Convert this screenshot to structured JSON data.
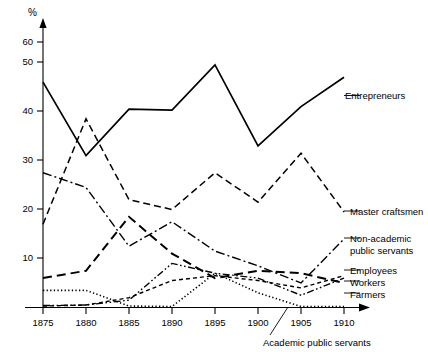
{
  "chart_data": {
    "type": "line",
    "title": "",
    "xlabel": "",
    "ylabel": "%",
    "y_unit_symbol": "%",
    "x": [
      1875,
      1880,
      1885,
      1890,
      1895,
      1900,
      1905,
      1910
    ],
    "xtick_labels": [
      "1875",
      "1880",
      "1885",
      "1890",
      "1895",
      "1900",
      "1905",
      "1910"
    ],
    "ytick_labels": [
      "10",
      "20",
      "30",
      "40",
      "50",
      "60"
    ],
    "ytick_values": [
      10,
      20,
      30,
      40,
      50,
      60
    ],
    "xlim": [
      1875,
      1911
    ],
    "ylim": [
      0,
      64
    ],
    "grid": false,
    "legend_position": "right-inline",
    "series": [
      {
        "name": "Entrepreneurs",
        "label": "Entrepreneurs",
        "style": "solid",
        "dash": "none",
        "width": 1.7,
        "values": [
          46,
          31,
          40.5,
          40.3,
          49.5,
          33,
          41,
          47
        ]
      },
      {
        "name": "Master craftsmen",
        "label": "Master craftsmen",
        "style": "dashed",
        "dash": "7,4",
        "width": 1.5,
        "values": [
          17,
          38.5,
          22,
          20,
          27.5,
          21.5,
          31.5,
          19.5
        ]
      },
      {
        "name": "Non-academic public servants",
        "label": "Non-academic\npublic servants",
        "label_line1": "Non-academic",
        "label_line2": "public servants",
        "style": "dash-dot",
        "dash": "9,3,2,3",
        "width": 1.4,
        "values": [
          27.5,
          24.5,
          12.5,
          17.5,
          11.5,
          8.5,
          5,
          14
        ]
      },
      {
        "name": "Employees",
        "label": "Employees",
        "style": "long-dash",
        "dash": "9,5",
        "width": 2.0,
        "values": [
          6,
          7.5,
          18.5,
          11,
          6,
          7.5,
          7,
          5
        ]
      },
      {
        "name": "Workers",
        "label": "Workers",
        "style": "dash-dot-dot",
        "dash": "7,2.5,1.6,2.5,1.6,2.5",
        "width": 1.4,
        "values": [
          0.4,
          0.5,
          1.5,
          9,
          7,
          6,
          2.5,
          6
        ]
      },
      {
        "name": "Farmers",
        "label": "Farmers",
        "style": "short-dash",
        "dash": "4,3",
        "width": 1.4,
        "values": [
          0.3,
          0.5,
          2,
          5.5,
          6.5,
          5.5,
          4,
          6.5
        ]
      },
      {
        "name": "Academic public servants",
        "label": "Academic public servants",
        "style": "dotted",
        "dash": "1.3,2.3",
        "width": 1.6,
        "values": [
          3.5,
          3.5,
          0.3,
          0.2,
          7,
          3,
          0.2,
          0.2
        ]
      }
    ],
    "annotations": [
      {
        "name": "entrepreneurs-label",
        "text": "Entrepreneurs",
        "x": 345,
        "y": 99
      },
      {
        "name": "master-craftsmen-label",
        "text": "Master craftsmen",
        "x": 350,
        "y": 215
      },
      {
        "name": "non-academic-label-1",
        "text": "Non-academic",
        "x": 350,
        "y": 242
      },
      {
        "name": "non-academic-label-2",
        "text": "public servants",
        "x": 350,
        "y": 254
      },
      {
        "name": "employees-label",
        "text": "Employees",
        "x": 350,
        "y": 273
      },
      {
        "name": "workers-label",
        "text": "Workers",
        "x": 350,
        "y": 285
      },
      {
        "name": "farmers-label",
        "text": "Farmers",
        "x": 350,
        "y": 297
      },
      {
        "name": "academic-public-servants-label",
        "text": "Academic public servants",
        "x": 263,
        "y": 344
      }
    ]
  }
}
